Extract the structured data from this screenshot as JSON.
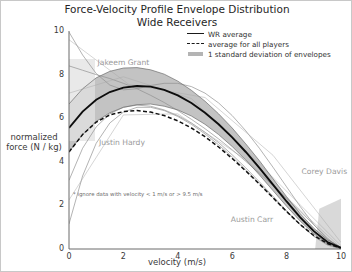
{
  "chart_data": {
    "type": "line",
    "title": "Force-Velocity Profile Envelope Distribution\nWide Receivers",
    "xlabel": "velocity (m/s)",
    "ylabel": "normalized\nforce (N / kg)",
    "xlim": [
      0,
      10
    ],
    "ylim": [
      0,
      10
    ],
    "xticks": [
      0,
      2,
      4,
      6,
      8,
      10
    ],
    "yticks": [
      0,
      2,
      4,
      6,
      8,
      10
    ],
    "grid": false,
    "legend_position": "top-right",
    "legend": [
      {
        "label": "WR average",
        "style": "solid-line",
        "color": "#1a1a1a"
      },
      {
        "label": "average for all players",
        "style": "dashed-line",
        "color": "#1a1a1a"
      },
      {
        "label": "1 standard deviation of envelopes",
        "style": "band",
        "color": "#b4b4b4"
      }
    ],
    "note": "* ignore data with velocity < 1 m/s or > 9.5 m/s",
    "annotations": [
      {
        "label": "Jakeem Grant",
        "x": 1.05,
        "y": 8.55
      },
      {
        "label": "Justin Hardy",
        "x": 1.1,
        "y": 4.85
      },
      {
        "label": "Corey Davis",
        "x": 8.55,
        "y": 3.55
      },
      {
        "label": "Austin Carr",
        "x": 5.95,
        "y": 1.35
      }
    ],
    "series": [
      {
        "name": "WR average",
        "style": "solid-line",
        "x": [
          0,
          0.5,
          1,
          1.5,
          2,
          2.5,
          3,
          3.5,
          4,
          4.5,
          5,
          5.5,
          6,
          6.5,
          7,
          7.5,
          8,
          8.5,
          9,
          9.5,
          10
        ],
        "y": [
          5.55,
          6.3,
          6.85,
          7.2,
          7.4,
          7.48,
          7.45,
          7.3,
          7.05,
          6.7,
          6.25,
          5.72,
          5.12,
          4.45,
          3.72,
          2.95,
          2.18,
          1.45,
          0.82,
          0.32,
          0.05
        ]
      },
      {
        "name": "average for all players",
        "style": "dashed-line",
        "x": [
          0,
          0.5,
          1,
          1.5,
          2,
          2.5,
          3,
          3.5,
          4,
          4.5,
          5,
          5.5,
          6,
          6.5,
          7,
          7.5,
          8,
          8.5,
          9,
          9.5,
          10
        ],
        "y": [
          4.45,
          5.25,
          5.82,
          6.15,
          6.3,
          6.35,
          6.28,
          6.12,
          5.88,
          5.55,
          5.15,
          4.68,
          4.15,
          3.58,
          2.98,
          2.35,
          1.72,
          1.12,
          0.62,
          0.25,
          0.03
        ]
      },
      {
        "name": "std upper",
        "style": "band-edge",
        "x": [
          0,
          0.5,
          1,
          1.5,
          2,
          2.5,
          3,
          3.5,
          4,
          4.5,
          5,
          5.5,
          6,
          6.5,
          7,
          7.5,
          8,
          8.5,
          9,
          9.5,
          10
        ],
        "y": [
          6.65,
          7.35,
          7.85,
          8.15,
          8.3,
          8.32,
          8.22,
          8.02,
          7.7,
          7.28,
          6.78,
          6.2,
          5.55,
          4.82,
          4.05,
          3.22,
          2.4,
          1.62,
          0.95,
          0.42,
          0.08
        ]
      },
      {
        "name": "std lower",
        "style": "band-edge",
        "x": [
          0,
          0.5,
          1,
          1.5,
          2,
          2.5,
          3,
          3.5,
          4,
          4.5,
          5,
          5.5,
          6,
          6.5,
          7,
          7.5,
          8,
          8.5,
          9,
          9.5,
          10
        ],
        "y": [
          4.45,
          5.25,
          5.85,
          6.25,
          6.5,
          6.62,
          6.65,
          6.55,
          6.38,
          6.1,
          5.72,
          5.25,
          4.7,
          4.08,
          3.4,
          2.68,
          1.96,
          1.28,
          0.7,
          0.25,
          0.02
        ]
      },
      {
        "name": "Jakeem Grant",
        "style": "thin-line",
        "x": [
          0,
          0.5,
          1,
          1.5,
          2,
          2.5,
          3,
          3.5,
          4,
          4.5,
          5,
          5.5,
          6,
          6.5,
          7,
          7.5,
          8,
          8.5,
          9,
          9.5,
          10
        ],
        "y": [
          9.95,
          8.9,
          8.05,
          7.52,
          7.3,
          7.35,
          7.5,
          7.6,
          7.6,
          7.45,
          7.15,
          6.7,
          6.12,
          5.42,
          4.62,
          3.75,
          2.85,
          1.95,
          1.12,
          0.45,
          0.05
        ]
      },
      {
        "name": "Justin Hardy",
        "style": "thin-line",
        "x": [
          0,
          0.5,
          1,
          1.5,
          2,
          2.5,
          3,
          3.5,
          4,
          4.5,
          5,
          5.5,
          6,
          6.5,
          7,
          7.5,
          8,
          8.5,
          9,
          9.5,
          10
        ],
        "y": [
          1.15,
          3.35,
          4.85,
          5.78,
          6.28,
          6.5,
          6.5,
          6.35,
          6.08,
          5.72,
          5.28,
          4.78,
          4.22,
          3.62,
          3.0,
          2.35,
          1.72,
          1.12,
          0.6,
          0.22,
          0.02
        ]
      },
      {
        "name": "Corey Davis",
        "style": "thin-line",
        "x": [
          0,
          0.5,
          1,
          1.5,
          2,
          2.5,
          3,
          3.5,
          4,
          4.5,
          5,
          5.5,
          6,
          6.5,
          7,
          7.5,
          8,
          8.5,
          9,
          9.5,
          10
        ],
        "y": [
          8.4,
          8.2,
          8.0,
          7.82,
          7.6,
          7.35,
          7.05,
          6.72,
          6.35,
          5.95,
          5.52,
          5.05,
          4.55,
          4.02,
          3.48,
          2.9,
          2.32,
          1.72,
          1.12,
          0.5,
          0.0
        ]
      },
      {
        "name": "Austin Carr",
        "style": "thin-line",
        "x": [
          0,
          0.5,
          1,
          1.5,
          2,
          2.5,
          3,
          3.5,
          4,
          4.5,
          5,
          5.5,
          6,
          6.5,
          7,
          7.5,
          8,
          8.5,
          9,
          9.5,
          10
        ],
        "y": [
          3.15,
          4.62,
          5.6,
          6.2,
          6.5,
          6.6,
          6.55,
          6.38,
          6.12,
          5.78,
          5.35,
          4.88,
          4.32,
          3.72,
          3.08,
          2.42,
          1.75,
          1.12,
          0.58,
          0.18,
          0.0
        ]
      }
    ]
  }
}
